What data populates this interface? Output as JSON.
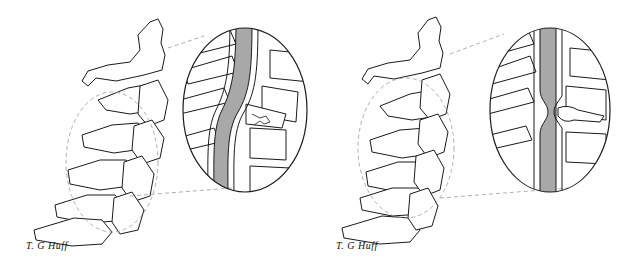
{
  "illustration": {
    "description": "Two-panel line drawing of the cervical spine (lateral view) with magnified oval insets of the spinal canal",
    "panels": [
      {
        "id": "left",
        "signature": "T. G Huff",
        "inset_finding": "vertebral body compression fracture with cord impingement"
      },
      {
        "id": "right",
        "signature": "T. G Huff",
        "inset_finding": "intervertebral disc herniation indenting the spinal cord"
      }
    ],
    "colors": {
      "line": "#1a1a1a",
      "cord_fill": "#a8a8a8",
      "background": "#ffffff",
      "dash": "#9a9a9a"
    }
  }
}
